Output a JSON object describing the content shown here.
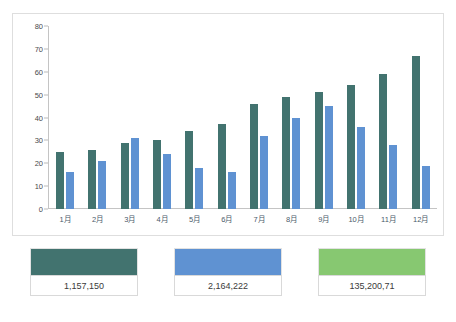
{
  "top_caption": "",
  "chart_data": {
    "type": "bar",
    "title": "",
    "subtitle": "",
    "xlabel": "",
    "ylabel": "",
    "ylim": [
      0,
      80
    ],
    "ytick_step": 10,
    "yticks": [
      "80",
      "70",
      "60",
      "50",
      "40",
      "30",
      "20",
      "10",
      "0"
    ],
    "ytick_values": [
      80,
      70,
      60,
      50,
      40,
      30,
      20,
      10,
      0
    ],
    "grid": false,
    "legend_position": "bottom",
    "categories": [
      "1月",
      "2月",
      "3月",
      "4月",
      "5月",
      "6月",
      "7月",
      "8月",
      "9月",
      "10月",
      "11月",
      "12月"
    ],
    "series": [
      {
        "name": "1,157,150",
        "color": "#42736f",
        "values": [
          25,
          26,
          29,
          30,
          34,
          37,
          46,
          49,
          51,
          54,
          59,
          67
        ]
      },
      {
        "name": "2,164,222",
        "color": "#5f92d2",
        "values": [
          16,
          21,
          31,
          24,
          18,
          16,
          32,
          40,
          45,
          36,
          28,
          19
        ]
      }
    ]
  },
  "legend": {
    "items": [
      {
        "label": "1,157,150",
        "color": "#42736f"
      },
      {
        "label": "2,164,222",
        "color": "#5f92d2"
      },
      {
        "label": "135,200,71",
        "color": "#87c871"
      }
    ]
  }
}
